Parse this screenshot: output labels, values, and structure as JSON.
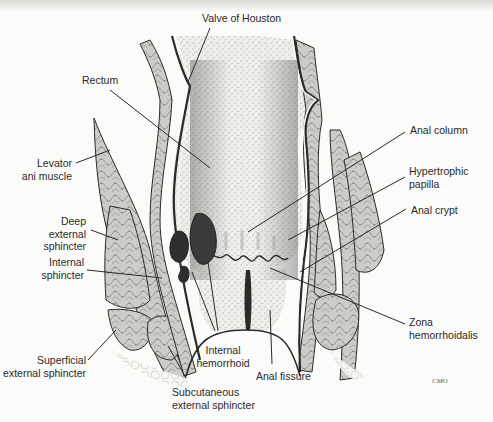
{
  "figure": {
    "signature": "CMO",
    "colors": {
      "ink": "#2a2a2a",
      "muscle_fill": "#c9c9c4",
      "lumen_fill": "#ecece8",
      "hemorrhoid_fill": "#3a3a3a",
      "background": "#fbfbf9"
    }
  },
  "labels": {
    "valve_of_houston": "Valve of Houston",
    "rectum": "Rectum",
    "levator_ani": "Levator\nani muscle",
    "deep_external_sphincter": "Deep\nexternal\nsphincter",
    "internal_sphincter": "Internal\nsphincter",
    "superficial_external_sphincter": "Superficial\nexternal sphincter",
    "subcutaneous_external_sphincter": "Subcutaneous\nexternal sphincter",
    "internal_hemorrhoid": "Internal\nhemorrhoid",
    "anal_fissure": "Anal fissure",
    "anal_column": "Anal column",
    "hypertrophic_papilla": "Hypertrophic\npapilla",
    "anal_crypt": "Anal crypt",
    "zona_hemorrhoidalis": "Zona\nhemorrhoidalis"
  }
}
